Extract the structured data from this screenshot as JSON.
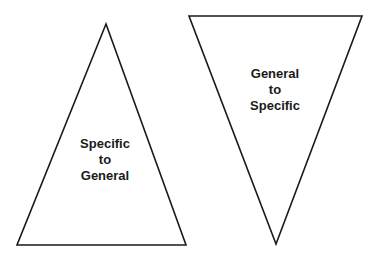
{
  "diagram": {
    "triangle_up": {
      "lines": [
        "Specific",
        "to",
        "General"
      ],
      "points": "106,24 17,245 186,245"
    },
    "triangle_down": {
      "lines": [
        "General",
        "to",
        "Specific"
      ],
      "points": "189,16 362,16 276,244"
    },
    "stroke_color": "#1a1a1a",
    "background": "#ffffff"
  }
}
